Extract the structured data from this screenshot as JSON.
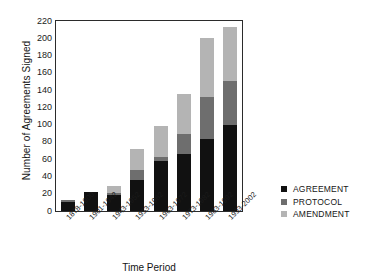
{
  "chart_data": {
    "type": "bar",
    "subtype": "stacked-bar",
    "title": "",
    "xlabel": "Time Period",
    "ylabel": "Number of Agreements Signed",
    "ylim": [
      0,
      220
    ],
    "ytick_step": 20,
    "yticks": [
      0,
      20,
      40,
      60,
      80,
      100,
      120,
      140,
      160,
      180,
      200,
      220
    ],
    "ytick_labels": [
      "0",
      "20",
      "40",
      "60",
      "80",
      "100",
      "120",
      "140",
      "160",
      "180",
      "200",
      "220"
    ],
    "grid": false,
    "legend_position": "right",
    "categories": [
      "1878-1900",
      "1901-1942",
      "1943-1952",
      "1953-1962",
      "1963-1972",
      "1973-1982",
      "1983-1992",
      "1993-2002"
    ],
    "series": [
      {
        "name": "AGREEMENT",
        "color": "#111111",
        "values": [
          10,
          22,
          18,
          36,
          58,
          66,
          83,
          100
        ]
      },
      {
        "name": "PROTOCOL",
        "color": "#6e6e6e",
        "values": [
          3,
          0,
          3,
          11,
          4,
          23,
          49,
          50
        ]
      },
      {
        "name": "AMENDMENT",
        "color": "#b4b4b4",
        "values": [
          0,
          0,
          8,
          25,
          37,
          46,
          68,
          63
        ]
      }
    ],
    "totals": [
      13,
      22,
      29,
      72,
      99,
      135,
      200,
      213
    ]
  },
  "axes": {
    "y_title": "Number of Agreements Signed",
    "x_title": "Time Period"
  },
  "legend": {
    "items": [
      {
        "label": "AGREEMENT",
        "color": "#111111"
      },
      {
        "label": "PROTOCOL",
        "color": "#6e6e6e"
      },
      {
        "label": "AMENDMENT",
        "color": "#b4b4b4"
      }
    ]
  }
}
